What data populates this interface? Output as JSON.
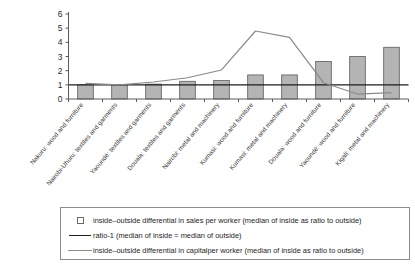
{
  "chart_data": {
    "type": "bar",
    "title": "",
    "subtitle": "",
    "xlabel": "",
    "ylabel": "",
    "ylim": [
      0,
      6
    ],
    "ytick_labels": [
      "0",
      "1",
      "2",
      "3",
      "4",
      "5",
      "6"
    ],
    "grid": false,
    "legend_position": "bottom",
    "categories": [
      "Nakuru: wood and furniture",
      "Nairobi-Uhuru: textiles and garments",
      "Yaoundé: textiles and garments",
      "Douala: textiles and garments",
      "Nairobi: metal and machinery",
      "Kumasi: wood and furniture",
      "Kumasi: metal and machinery",
      "Douala: wood and furniture",
      "Yaoundé: wood and furniture",
      "Kigali: metal and machinery"
    ],
    "series": [
      {
        "name": "inside-outside differential in sales per worker (median of inside as ratio to outside)",
        "type": "bar",
        "color": "#b4b4b4",
        "edge_color": "#5d5d5d",
        "values": [
          1.0,
          1.0,
          1.05,
          1.25,
          1.3,
          1.7,
          1.7,
          2.65,
          3.0,
          3.65
        ]
      },
      {
        "name": "ratio-1 (median of inside = median of outside)",
        "type": "line",
        "color": "#1d1d1d",
        "values": [
          1.0,
          1.0,
          1.0,
          1.0,
          1.0,
          1.0,
          1.0,
          1.0,
          1.0,
          1.0
        ]
      },
      {
        "name": "inside-outside differential in capitalper worker (median of inside as ratio to outside)",
        "type": "line",
        "color": "#8a8a8a",
        "values": [
          1.1,
          1.0,
          1.2,
          1.5,
          2.05,
          4.8,
          4.35,
          1.15,
          0.35,
          0.45
        ]
      }
    ]
  },
  "legend": {
    "entries": [
      {
        "key": "swatch",
        "label": "inside–outside differential in sales per worker (median of inside as ratio to outside)"
      },
      {
        "key": "black-line",
        "label": "ratio-1 (median of inside = median of outside)"
      },
      {
        "key": "gray-line",
        "label": "inside–outside differential in capitalper worker (median of inside as ratio to outside)"
      }
    ]
  }
}
